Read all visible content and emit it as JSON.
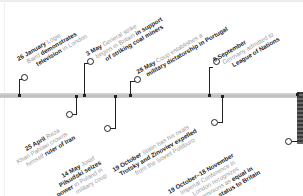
{
  "timeline": {
    "events": [
      {
        "date": "26 January",
        "lines": [
          [
            "Logie"
          ],
          [
            "Baird ",
            "demonstrates"
          ],
          [
            "television",
            " in London"
          ]
        ],
        "text": "Logie Baird demonstrates television in London"
      },
      {
        "date": "25 April",
        "text": "Reza Khan Pahlavi crowns himself ruler of Iran"
      },
      {
        "date": "3 May",
        "text": "General strike begins in Britain in support of striking coal miners"
      },
      {
        "date": "14 May",
        "text": "Josef Pilsudski seizes power in Poland in military coup"
      },
      {
        "date": "28 May",
        "text": "Coup establishes a military dictatorship in Portugal"
      },
      {
        "date": "8 September",
        "text": "Germany admitted to League of Nations"
      },
      {
        "date": "19 October",
        "text": "Stalin has his rivals Trotsky and Zinoviev expelled from the Soviet Politburo"
      },
      {
        "date": "19 October–18 November",
        "text": "Imperial Conference in London recognizes Dominions as equal in status to Britain"
      }
    ],
    "e0": {
      "date": "26 January",
      "a": " Logie",
      "b": "Baird ",
      "c": "demonstrates",
      "d": "television",
      "e": " in London"
    },
    "e1": {
      "date": "25 April",
      "a": " Reza",
      "b": "Khan Pahlavi crowns",
      "c": "himself ",
      "d": "ruler of Iran"
    },
    "e2": {
      "date": "3 May",
      "a": " General strike",
      "b": "begins in Britain ",
      "c": "in support",
      "d": "of striking coal miners"
    },
    "e3": {
      "date": "14 May",
      "a": " Josef",
      "b": "Pilsudski ",
      "c": "seizes",
      "d": "power",
      "e": " in Poland in",
      "f": "military coup"
    },
    "e4": {
      "date": "28 May",
      "a": " Coup establishes a",
      "b": "military dictatorship in Portugal"
    },
    "e5": {
      "date": "8 September",
      "a": "Germany admitted to",
      "b": "League of Nations"
    },
    "e6": {
      "date": "19 October",
      "a": " Stalin has his rivals",
      "b": "Trotsky and Zinoviev expelled",
      "c": "from the Soviet Politburo"
    },
    "e7": {
      "date": "19 October–18 November",
      "a": "Imperial Conference in",
      "b": "London recognizes",
      "c": "Dominions as ",
      "d": "equal in",
      "e": "status to Britain"
    }
  }
}
